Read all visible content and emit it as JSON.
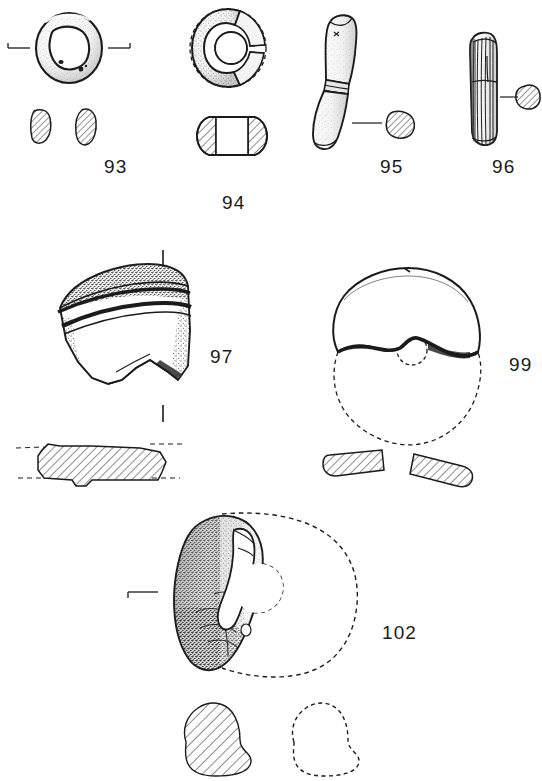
{
  "plate": {
    "title": "Archaeological artefact illustration plate",
    "medium": "ink line drawing with stipple shading and section hatching",
    "background_color": "#ffffff",
    "ink_color": "#1b1b1b",
    "width": 542,
    "height": 781
  },
  "figures": [
    {
      "id": "fig-93",
      "label": "93",
      "label_x": 104,
      "label_y": 156,
      "description": "annular ring bead, plan view with two hatched cross-sections below",
      "views": [
        "plan",
        "section-left",
        "section-right"
      ],
      "axis_marks": 2,
      "reconstructed": false
    },
    {
      "id": "fig-94",
      "label": "94",
      "label_x": 222,
      "label_y": 192,
      "description": "fragmentary ring bead, plan view with dashed reconstruction and barrel profile below",
      "views": [
        "plan",
        "profile"
      ],
      "axis_marks": 0,
      "reconstructed": true
    },
    {
      "id": "fig-95",
      "label": "95",
      "label_x": 380,
      "label_y": 156,
      "description": "curved bone rod or pin with constriction band, with hatched cross-section on leader line",
      "views": [
        "elevation",
        "section"
      ],
      "axis_marks": 0,
      "reconstructed": false
    },
    {
      "id": "fig-96",
      "label": "96",
      "label_x": 492,
      "label_y": 156,
      "description": "straight longitudinally striated rod, with hatched cross-section on leader line",
      "views": [
        "elevation",
        "section"
      ],
      "axis_marks": 0,
      "reconstructed": false
    },
    {
      "id": "fig-97",
      "label": "97",
      "label_x": 210,
      "label_y": 346,
      "description": "pottery rim sherd with horizontal bands, with hatched profile section below",
      "views": [
        "exterior",
        "profile"
      ],
      "axis_marks": 2,
      "reconstructed": false
    },
    {
      "id": "fig-99",
      "label": "99",
      "label_x": 509,
      "label_y": 354,
      "description": "perforated disc fragment with dashed reconstructed circumference, two hatched sections below",
      "views": [
        "plan",
        "section-left",
        "section-right"
      ],
      "axis_marks": 0,
      "reconstructed": true
    },
    {
      "id": "fig-102",
      "label": "102",
      "label_x": 382,
      "label_y": 622,
      "description": "stone fragment with perforation, dashed reconstructed outline, hatched and dashed sections below",
      "views": [
        "plan",
        "section-hatched",
        "section-dashed"
      ],
      "axis_marks": 1,
      "reconstructed": true
    }
  ]
}
